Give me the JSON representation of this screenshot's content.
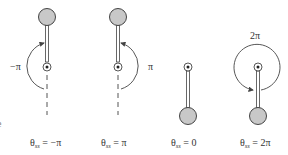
{
  "diagram": {
    "colors": {
      "bob_fill": "#c8c8c8",
      "stroke": "#444444",
      "dash": "#555555"
    },
    "edge_fragment": "e",
    "pendulums": [
      {
        "id": "neg-pi",
        "theta_symbol": "θ",
        "subscript": "ss",
        "value_text": "= −π",
        "angle_label": "−π",
        "orientation": "up",
        "arrow": "left-half-ccw"
      },
      {
        "id": "pos-pi",
        "theta_symbol": "θ",
        "subscript": "ss",
        "value_text": "= π",
        "angle_label": "π",
        "orientation": "up",
        "arrow": "right-half-cw"
      },
      {
        "id": "zero",
        "theta_symbol": "θ",
        "subscript": "ss",
        "value_text": "= 0",
        "angle_label": "",
        "orientation": "down",
        "arrow": "none"
      },
      {
        "id": "two-pi",
        "theta_symbol": "θ",
        "subscript": "ss",
        "value_text": "= 2π",
        "angle_label": "2π",
        "orientation": "down",
        "arrow": "full-circle"
      }
    ]
  }
}
